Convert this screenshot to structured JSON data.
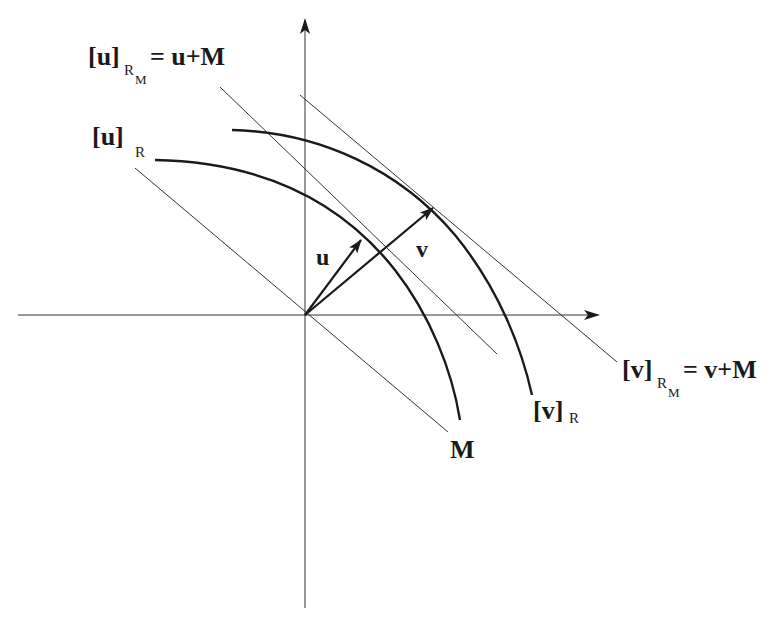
{
  "diagram": {
    "origin": [
      305,
      315
    ],
    "labels": {
      "u_rm_base": "[u]",
      "u_rm_sub1": "R",
      "u_rm_sub2": "M",
      "u_rm_rhs": "= u+M",
      "u_r_base": "[u]",
      "u_r_sub": "R",
      "v_rm_base": "[v]",
      "v_rm_sub1": "R",
      "v_rm_sub2": "M",
      "v_rm_rhs": "= v+M",
      "v_r_base": "[v]",
      "v_r_sub": "R",
      "vec_u": "u",
      "vec_v": "v",
      "line_m": "M"
    },
    "elements": {
      "x_axis": "horizontal axis with arrow",
      "y_axis": "vertical axis with arrow",
      "line_M": "line M through origin",
      "line_u_plus_M": "affine line u+M",
      "line_v_plus_M": "affine line v+M",
      "arc_u_R": "arc [u]_R",
      "arc_v_R": "arc [v]_R",
      "vector_u": "vector u",
      "vector_v": "vector v"
    }
  }
}
